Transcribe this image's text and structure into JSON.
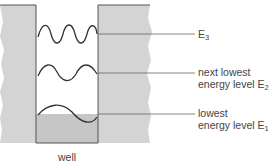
{
  "diagram": {
    "well_label": "well",
    "levels": [
      {
        "id": "E3",
        "text": "",
        "symbol": "E",
        "subscript": "3"
      },
      {
        "id": "E2",
        "line1": "next lowest",
        "line2": "energy level E",
        "subscript": "2"
      },
      {
        "id": "E1",
        "line1": "lowest",
        "line2": "energy level E",
        "subscript": "1"
      }
    ],
    "colors": {
      "wall_fill": "#d2d2d2",
      "well_fill": "#c8c8c8",
      "line": "#555555",
      "text": "#444444"
    }
  }
}
